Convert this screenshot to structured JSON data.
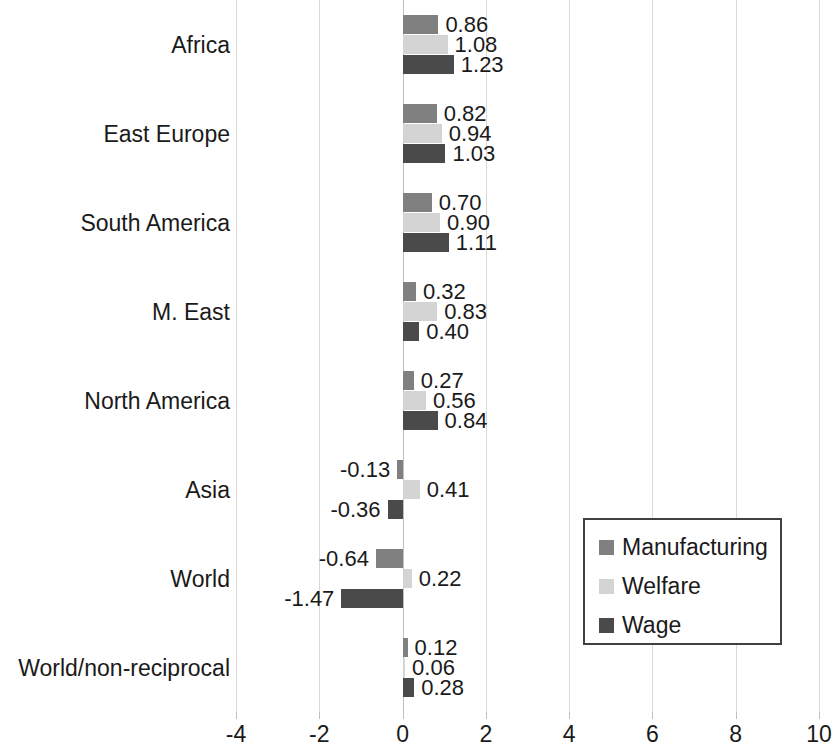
{
  "chart_data": {
    "type": "bar",
    "orientation": "horizontal",
    "title": "",
    "xlabel": "",
    "ylabel": "",
    "xlim": [
      -4,
      10
    ],
    "xticks": [
      -4,
      -2,
      0,
      2,
      4,
      6,
      8,
      10
    ],
    "xtick_labels": [
      "-4",
      "-2",
      "0",
      "2",
      "4",
      "6",
      "8",
      "10"
    ],
    "grid": true,
    "legend_position": "center-right",
    "categories": [
      "Africa",
      "East Europe",
      "South America",
      "M. East",
      "North America",
      "Asia",
      "World",
      "World/non-reciprocal"
    ],
    "series": [
      {
        "name": "Manufacturing",
        "color": "#808080",
        "values": [
          0.86,
          0.82,
          0.7,
          0.32,
          0.27,
          -0.13,
          -0.64,
          0.12
        ],
        "labels": [
          "0.86",
          "0.82",
          "0.70",
          "0.32",
          "0.27",
          "-0.13",
          "-0.64",
          "0.12"
        ]
      },
      {
        "name": "Welfare",
        "color": "#d4d4d4",
        "values": [
          1.08,
          0.94,
          0.9,
          0.83,
          0.56,
          0.41,
          0.22,
          0.06
        ],
        "labels": [
          "1.08",
          "0.94",
          "0.90",
          "0.83",
          "0.56",
          "0.41",
          "0.22",
          "0.06"
        ]
      },
      {
        "name": "Wage",
        "color": "#4a4a4a",
        "values": [
          1.23,
          1.03,
          1.11,
          0.4,
          0.84,
          -0.36,
          -1.47,
          0.28
        ],
        "labels": [
          "1.23",
          "1.03",
          "1.11",
          "0.40",
          "0.84",
          "-0.36",
          "-1.47",
          "0.28"
        ]
      }
    ]
  },
  "legend": {
    "items": [
      {
        "label": "Manufacturing",
        "color": "#808080"
      },
      {
        "label": "Welfare",
        "color": "#d4d4d4"
      },
      {
        "label": "Wage",
        "color": "#4a4a4a"
      }
    ]
  }
}
